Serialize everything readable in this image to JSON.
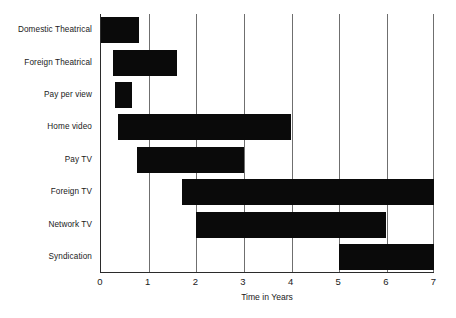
{
  "chart_data": {
    "type": "bar",
    "orientation": "horizontal",
    "subtype": "floating-bar-gantt",
    "title": "",
    "xlabel": "Time in Years",
    "ylabel": "",
    "xlim": [
      0,
      7
    ],
    "xticks": [
      "0",
      "1",
      "2",
      "3",
      "4",
      "5",
      "6",
      "7"
    ],
    "grid": true,
    "grid_axis": "x",
    "legend": false,
    "bar_color": "#0a0a0a",
    "categories": [
      "Domestic Theatrical",
      "Foreign Theatrical",
      "Pay per view",
      "Home video",
      "Pay TV",
      "Foreign TV",
      "Network TV",
      "Syndication"
    ],
    "bars": [
      {
        "category": "Domestic Theatrical",
        "start": 0.0,
        "end": 0.8
      },
      {
        "category": "Foreign Theatrical",
        "start": 0.25,
        "end": 1.6
      },
      {
        "category": "Pay per view",
        "start": 0.3,
        "end": 0.65
      },
      {
        "category": "Home video",
        "start": 0.35,
        "end": 4.0
      },
      {
        "category": "Pay TV",
        "start": 0.75,
        "end": 3.0
      },
      {
        "category": "Foreign TV",
        "start": 1.7,
        "end": 7.0
      },
      {
        "category": "Network TV",
        "start": 2.0,
        "end": 6.0
      },
      {
        "category": "Syndication",
        "start": 5.0,
        "end": 7.0
      }
    ]
  }
}
